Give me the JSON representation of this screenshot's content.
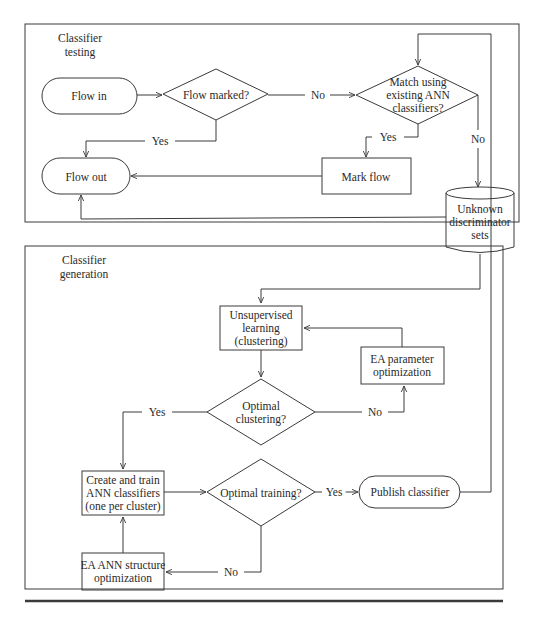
{
  "sections": {
    "testing": {
      "title_line1": "Classifier",
      "title_line2": "testing"
    },
    "generation": {
      "title_line1": "Classifier",
      "title_line2": "generation"
    }
  },
  "nodes": {
    "flow_in": {
      "label": "Flow in",
      "shape": "terminal"
    },
    "flow_marked": {
      "label": "Flow marked?",
      "shape": "decision"
    },
    "match": {
      "line1": "Match using",
      "line2": "existing ANN",
      "line3": "classifiers?",
      "shape": "decision"
    },
    "flow_out": {
      "label": "Flow out",
      "shape": "terminal"
    },
    "mark_flow": {
      "label": "Mark flow",
      "shape": "process"
    },
    "unknown_sets": {
      "line1": "Unknown",
      "line2": "discriminator",
      "line3": "sets",
      "shape": "database"
    },
    "unsupervised": {
      "line1": "Unsupervised",
      "line2": "learning",
      "line3": "(clustering)",
      "shape": "process"
    },
    "ea_param": {
      "line1": "EA parameter",
      "line2": "optimization",
      "shape": "process"
    },
    "optimal_clustering": {
      "line1": "Optimal",
      "line2": "clustering?",
      "shape": "decision"
    },
    "create_train": {
      "line1": "Create and train",
      "line2": "ANN classifiers",
      "line3": "(one per cluster)",
      "shape": "process"
    },
    "optimal_training": {
      "label": "Optimal training?",
      "shape": "decision"
    },
    "publish": {
      "label": "Publish classifier",
      "shape": "terminal"
    },
    "ea_structure": {
      "line1": "EA ANN structure",
      "line2": "optimization",
      "shape": "process"
    }
  },
  "edges": {
    "flow_marked_no": "No",
    "flow_marked_yes": "Yes",
    "match_yes": "Yes",
    "match_no": "No",
    "clustering_yes": "Yes",
    "clustering_no": "No",
    "training_yes": "Yes",
    "training_no": "No"
  },
  "colors": {
    "stroke": "#3a3a3a",
    "text": "#2a2a2a",
    "background": "#ffffff"
  }
}
